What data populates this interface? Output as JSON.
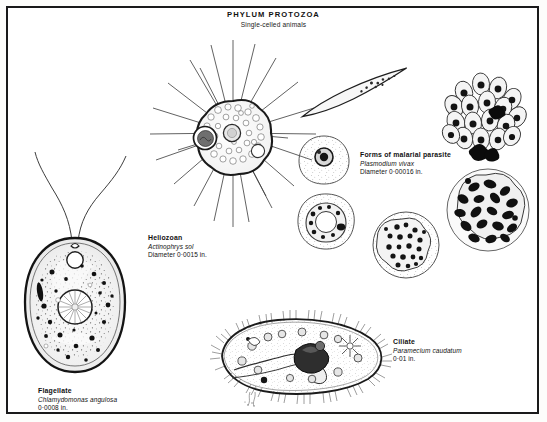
{
  "plate": {
    "title": "PHYLUM  PROTOZOA",
    "subtitle": "Single-celled animals",
    "border_color": "#1a1a1a",
    "background_color": "#ffffff",
    "ink_color": "#111111"
  },
  "figures": {
    "heliozoan": {
      "common_name": "Heliozoan",
      "scientific_name": "Actinophrys sol",
      "size": "Diameter 0·0015 in.",
      "spine_count": 24,
      "parts": [
        "axopodia",
        "vacuolated-cytoplasm",
        "nucleus",
        "food-vacuole"
      ]
    },
    "flagellate": {
      "common_name": "Flagellate",
      "scientific_name": "Chlamydomonas angulosa",
      "size": "0·0008 in.",
      "flagella_count": 2,
      "parts": [
        "flagella",
        "contractile-vacuole",
        "eyespot",
        "pyrenoid",
        "chloroplast",
        "cell-wall"
      ]
    },
    "malaria": {
      "common_name": "Forms of malarial parasite",
      "scientific_name": "Plasmodium vivax",
      "size": "Diameter 0·00016 in.",
      "stages": [
        "sporozoite",
        "ring-stage",
        "trophozoite",
        "amoeboid-trophozoite",
        "merozoite-cluster",
        "mature-schizont"
      ]
    },
    "ciliate": {
      "common_name": "Ciliate",
      "scientific_name": "Paramecium caudatum",
      "size": "0·01 in.",
      "parts": [
        "cilia",
        "oral-groove",
        "gullet",
        "macronucleus",
        "food-vacuoles",
        "contractile-vacuole"
      ]
    }
  }
}
